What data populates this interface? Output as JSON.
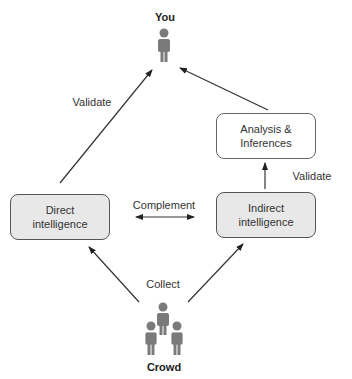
{
  "diagram": {
    "nodes": {
      "you": {
        "label": "You",
        "icon": "person-icon"
      },
      "crowd": {
        "label": "Crowd",
        "icon": "group-icon"
      },
      "direct": {
        "line1": "Direct",
        "line2": "intelligence"
      },
      "indirect": {
        "line1": "Indirect",
        "line2": "intelligence"
      },
      "analysis": {
        "line1": "Analysis &",
        "line2": "Inferences"
      }
    },
    "edges": {
      "validate_left": "Validate",
      "validate_right": "Validate",
      "complement": "Complement",
      "collect": "Collect"
    },
    "colors": {
      "shaded_box": "#e8e8e8",
      "icon": "#7a7a7a",
      "line": "#333333"
    }
  }
}
